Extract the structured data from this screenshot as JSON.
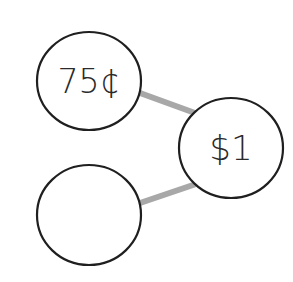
{
  "diagram": {
    "type": "number-bond",
    "colors": {
      "background": "#ffffff",
      "circle_stroke": "#1f1f1f",
      "connector": "#a8a8a8",
      "text": "#2a2a2a"
    },
    "nodes": [
      {
        "id": "part-1",
        "label": "75¢",
        "cx": 89,
        "cy": 81,
        "rx": 52,
        "ry": 49
      },
      {
        "id": "whole",
        "label": "$1",
        "cx": 231,
        "cy": 148,
        "rx": 52,
        "ry": 50
      },
      {
        "id": "part-2",
        "label": "",
        "cx": 89,
        "cy": 215,
        "rx": 52,
        "ry": 50
      }
    ],
    "connectors": [
      {
        "from": "part-1",
        "to": "whole",
        "x1": 140,
        "y1": 93,
        "x2": 195,
        "y2": 113
      },
      {
        "from": "part-2",
        "to": "whole",
        "x1": 140,
        "y1": 203,
        "x2": 196,
        "y2": 184
      }
    ]
  }
}
